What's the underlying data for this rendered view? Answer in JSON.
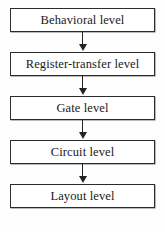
{
  "diagram": {
    "type": "vertical-flowchart",
    "background_color": "#fefefe",
    "box_border_color": "#2b2b2b",
    "box_fill_color": "#ffffff",
    "arrow_color": "#232323",
    "text_color": "#191919",
    "nodes": [
      {
        "id": "behavioral",
        "label": "Behavioral level"
      },
      {
        "id": "register-transfer",
        "label": "Register-transfer level"
      },
      {
        "id": "gate",
        "label": "Gate level"
      },
      {
        "id": "circuit",
        "label": "Circuit level"
      },
      {
        "id": "layout",
        "label": "Layout level"
      }
    ],
    "connectors": [
      {
        "from": "behavioral",
        "to": "register-transfer",
        "icon": "down-arrow-icon"
      },
      {
        "from": "register-transfer",
        "to": "gate",
        "icon": "down-arrow-icon"
      },
      {
        "from": "gate",
        "to": "circuit",
        "icon": "down-arrow-icon"
      },
      {
        "from": "circuit",
        "to": "layout",
        "icon": "down-arrow-icon"
      }
    ]
  }
}
